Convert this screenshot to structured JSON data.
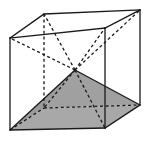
{
  "figure": {
    "canvas": {
      "width": 150,
      "height": 147,
      "background": "#ffffff"
    },
    "style": {
      "edge_color": "#1a1a1a",
      "hidden_edge_color": "#1a1a1a",
      "shade_fill": "#a8a8a8",
      "shade_stroke": "#4d4d4d",
      "edge_width": 1.3,
      "hidden_dash": "3,2.6"
    },
    "vertices": {
      "front_bottom_left": {
        "name": "A",
        "x": 10,
        "y": 130
      },
      "front_bottom_right": {
        "name": "B",
        "x": 105,
        "y": 128
      },
      "front_top_right": {
        "name": "C",
        "x": 105,
        "y": 28
      },
      "front_top_left": {
        "name": "D",
        "x": 10,
        "y": 38
      },
      "back_bottom_left": {
        "name": "E",
        "x": 44,
        "y": 108
      },
      "back_bottom_right": {
        "name": "F",
        "x": 140,
        "y": 105
      },
      "back_top_right": {
        "name": "G",
        "x": 140,
        "y": 10
      },
      "back_top_left": {
        "name": "H",
        "x": 44,
        "y": 14
      },
      "center_apex": {
        "name": "O",
        "x": 75,
        "y": 70
      }
    },
    "solid_edges": [
      {
        "name": "front-bottom",
        "from": "front_bottom_left",
        "to": "front_bottom_right"
      },
      {
        "name": "front-right",
        "from": "front_bottom_right",
        "to": "front_top_right"
      },
      {
        "name": "front-top",
        "from": "front_top_right",
        "to": "front_top_left"
      },
      {
        "name": "front-left",
        "from": "front_top_left",
        "to": "front_bottom_left"
      },
      {
        "name": "top-left-receding",
        "from": "front_top_left",
        "to": "back_top_left"
      },
      {
        "name": "top-right-receding",
        "from": "front_top_right",
        "to": "back_top_right"
      },
      {
        "name": "back-top",
        "from": "back_top_left",
        "to": "back_top_right"
      },
      {
        "name": "back-right-vertical",
        "from": "back_top_right",
        "to": "back_bottom_right"
      },
      {
        "name": "bottom-right-receding",
        "from": "front_bottom_right",
        "to": "back_bottom_right"
      }
    ],
    "hidden_edges": [
      {
        "name": "back-left-vertical",
        "from": "back_top_left",
        "to": "back_bottom_left"
      },
      {
        "name": "back-bottom",
        "from": "back_bottom_left",
        "to": "back_bottom_right"
      },
      {
        "name": "bottom-left-receding",
        "from": "front_bottom_left",
        "to": "back_bottom_left"
      }
    ],
    "pyramid_edges": [
      {
        "name": "apex-to-front-top-left",
        "hidden": true,
        "to": "front_top_left"
      },
      {
        "name": "apex-to-back-top-left",
        "hidden": true,
        "to": "back_top_left"
      },
      {
        "name": "apex-to-back-top-right",
        "hidden": true,
        "to": "back_top_right"
      },
      {
        "name": "apex-to-front-top-right",
        "hidden": true,
        "to": "front_top_right"
      },
      {
        "name": "apex-to-back-bottom-left",
        "hidden": true,
        "to": "back_bottom_left"
      },
      {
        "name": "apex-to-front-bottom-right",
        "hidden": true,
        "to": "front_bottom_right"
      },
      {
        "name": "apex-to-front-bottom-left",
        "hidden": false,
        "to": "front_bottom_left"
      },
      {
        "name": "apex-to-back-bottom-right",
        "hidden": false,
        "to": "back_bottom_right"
      }
    ],
    "shaded_faces": [
      {
        "name": "bottom-face",
        "points": "10,130 105,128 140,105 44,108",
        "fill": "#a8a8a8",
        "opacity": 1
      },
      {
        "name": "apex-triangle-left",
        "points": "10,130 75,70 44,108",
        "fill": "#9a9a9a",
        "opacity": 1
      },
      {
        "name": "apex-triangle-right",
        "points": "75,70 140,105 44,108",
        "fill": "#a0a0a0",
        "opacity": 1
      }
    ]
  }
}
